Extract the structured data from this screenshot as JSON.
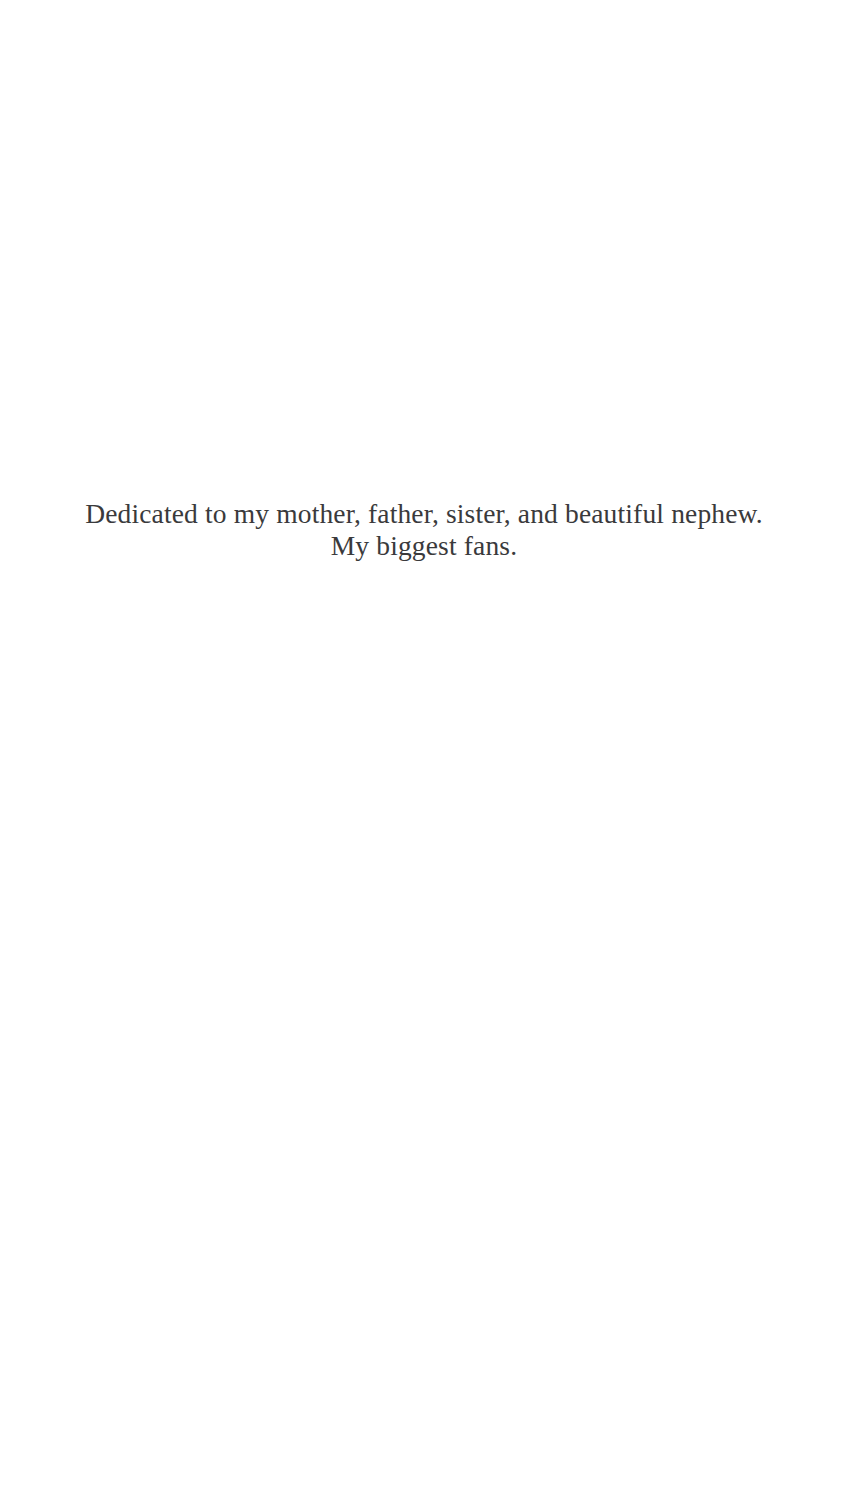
{
  "page": {
    "type": "book-dedication-page",
    "background_color": "#ffffff",
    "text_color": "#3a3a3c",
    "width": 848,
    "height": 1495
  },
  "dedication": {
    "alignment": "center",
    "lines": [
      "Dedicated to my mother, father, sister, and beautiful nephew.",
      "My biggest fans."
    ],
    "full_text": "Dedicated to my mother, father, sister, and beautiful nephew. My biggest fans."
  }
}
